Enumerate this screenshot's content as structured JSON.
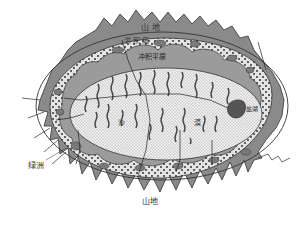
{
  "diagram": {
    "title": "",
    "colors": {
      "mountain": "#8a8a8a",
      "mountain_stroke": "#444444",
      "alluvial_fan": "#e6e6e6",
      "alluvial_plain": "#9a9a9a",
      "desert": "#ececec",
      "dune": "#555555",
      "salt_lake": "#555555",
      "oasis": "#7a7a7a"
    },
    "labels": {
      "mountain_top": "山  地",
      "alluvial_fan": "洪  积  扇",
      "alluvial_plain": "冲积平原",
      "desert_left": "沙",
      "desert_right": "漠",
      "salt_lake": "盐湖",
      "oasis": "绿洲",
      "mountain_bottom": "山地"
    }
  }
}
